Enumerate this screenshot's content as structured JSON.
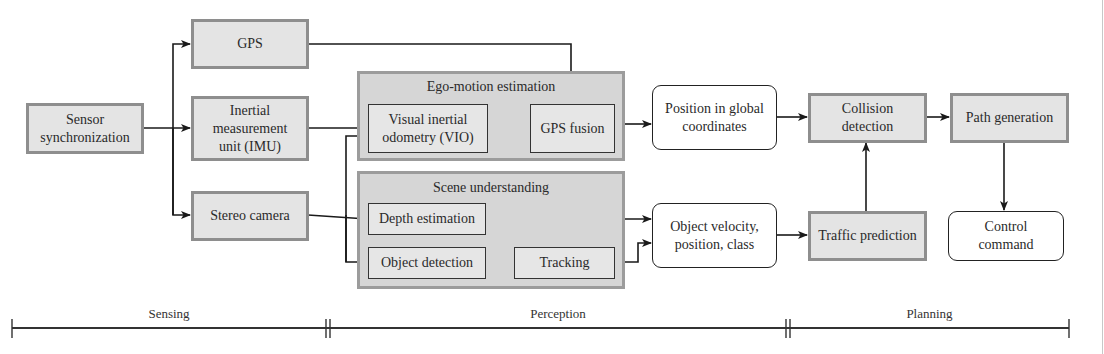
{
  "diagram": {
    "nodes": {
      "sensor_sync": "Sensor synchronization",
      "gps": "GPS",
      "imu": "Inertial measurement unit (IMU)",
      "stereo_camera": "Stereo camera",
      "vio": "Visual inertial odometry (VIO)",
      "gps_fusion": "GPS fusion",
      "depth_estimation": "Depth estimation",
      "object_detection": "Object detection",
      "tracking": "Tracking",
      "position_global": "Position in global coordinates",
      "object_velocity": "Object velocity, position, class",
      "collision_detection": "Collision detection",
      "path_generation": "Path generation",
      "traffic_prediction": "Traffic prediction",
      "control_command": "Control command"
    },
    "groups": {
      "ego_motion": "Ego-motion estimation",
      "scene_understanding": "Scene understanding"
    },
    "phases": {
      "sensing": "Sensing",
      "perception": "Perception",
      "planning": "Planning"
    },
    "edges": [
      [
        "sensor_sync",
        "gps"
      ],
      [
        "sensor_sync",
        "imu"
      ],
      [
        "sensor_sync",
        "stereo_camera"
      ],
      [
        "gps",
        "gps_fusion"
      ],
      [
        "imu",
        "vio"
      ],
      [
        "stereo_camera",
        "vio"
      ],
      [
        "stereo_camera",
        "depth_estimation"
      ],
      [
        "stereo_camera",
        "object_detection"
      ],
      [
        "vio",
        "gps_fusion"
      ],
      [
        "gps_fusion",
        "position_global"
      ],
      [
        "depth_estimation",
        "object_velocity"
      ],
      [
        "object_detection",
        "tracking"
      ],
      [
        "tracking",
        "object_velocity"
      ],
      [
        "position_global",
        "collision_detection"
      ],
      [
        "object_velocity",
        "traffic_prediction"
      ],
      [
        "traffic_prediction",
        "collision_detection"
      ],
      [
        "collision_detection",
        "path_generation"
      ],
      [
        "path_generation",
        "control_command"
      ]
    ]
  }
}
